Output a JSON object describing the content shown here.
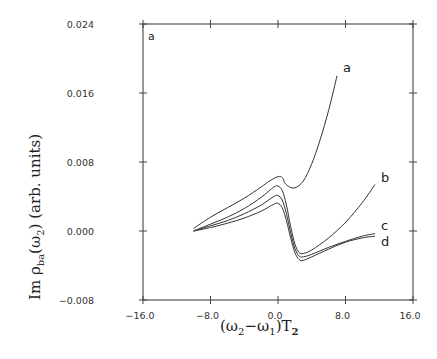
{
  "chart_data": {
    "type": "line",
    "title": "",
    "panel_label": "a",
    "xlabel": "(ω2−ω1)T2",
    "ylabel": "Im ρba(ω2) (arb. units)",
    "xlim": [
      -16.0,
      16.0
    ],
    "ylim": [
      -0.008,
      0.024
    ],
    "xticks": [
      "-16.0",
      "-8.0",
      "0.0",
      "8.0",
      "16.0"
    ],
    "yticks": [
      "0.024",
      "0.016",
      "0.008",
      "0.000",
      "-0.008"
    ],
    "grid": false,
    "legend": "inline curve labels at right end",
    "series": [
      {
        "name": "a",
        "x": [
          -10.0,
          -8.0,
          -6.0,
          -4.0,
          -2.0,
          -1.0,
          0.0,
          0.5,
          0.8,
          1.2,
          2.0,
          3.0,
          4.0,
          5.0,
          6.0,
          7.0
        ],
        "y": [
          0.0003,
          0.0016,
          0.0027,
          0.0038,
          0.0051,
          0.0058,
          0.0063,
          0.0062,
          0.0056,
          0.0052,
          0.005,
          0.0058,
          0.0078,
          0.0106,
          0.014,
          0.018
        ]
      },
      {
        "name": "b",
        "x": [
          -10.0,
          -8.0,
          -6.0,
          -4.0,
          -2.0,
          -0.5,
          0.0,
          0.5,
          1.0,
          1.5,
          2.0,
          2.5,
          3.0,
          4.0,
          6.0,
          8.0,
          10.0,
          11.5
        ],
        "y": [
          0.0,
          0.0008,
          0.0016,
          0.0026,
          0.0039,
          0.0051,
          0.0052,
          0.0047,
          0.003,
          0.0005,
          -0.0015,
          -0.0025,
          -0.0026,
          -0.0022,
          -0.0008,
          0.001,
          0.0033,
          0.0054
        ]
      },
      {
        "name": "c",
        "x": [
          -10.0,
          -8.0,
          -6.0,
          -4.0,
          -2.0,
          -0.5,
          0.0,
          0.5,
          1.0,
          1.5,
          2.0,
          2.5,
          3.0,
          4.0,
          6.0,
          8.0,
          10.0,
          11.5
        ],
        "y": [
          0.0,
          0.0006,
          0.0012,
          0.002,
          0.003,
          0.004,
          0.0041,
          0.0036,
          0.002,
          -0.0002,
          -0.002,
          -0.0029,
          -0.003,
          -0.0027,
          -0.0019,
          -0.0012,
          -0.0006,
          -0.0003
        ]
      },
      {
        "name": "d",
        "x": [
          -10.0,
          -8.0,
          -6.0,
          -4.0,
          -2.0,
          -0.5,
          0.0,
          0.5,
          1.0,
          1.5,
          2.0,
          2.5,
          3.0,
          4.0,
          6.0,
          8.0,
          10.0,
          11.5
        ],
        "y": [
          0.0,
          0.0004,
          0.0009,
          0.0015,
          0.0023,
          0.0031,
          0.0032,
          0.0027,
          0.0012,
          -0.0008,
          -0.0025,
          -0.0033,
          -0.0034,
          -0.003,
          -0.0021,
          -0.0013,
          -0.0008,
          -0.0006
        ]
      }
    ]
  },
  "axes": {
    "x_title_main": "(ω",
    "x_title_sub1": "2",
    "x_title_mid": "−ω",
    "x_title_sub2": "1",
    "x_title_end": ")T",
    "x_title_sub3": "2",
    "y_title_main": "Im ρ",
    "y_title_sub": "ba",
    "y_title_rest": "(ω",
    "y_title_sub2": "2",
    "y_title_end": ")  (arb. units)"
  }
}
